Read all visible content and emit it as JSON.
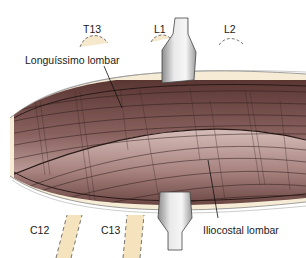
{
  "figure": {
    "labels": {
      "longissimus": "Longuíssimo lombar",
      "iliocostal": "Iliocostal lombar",
      "t13": "T13",
      "l1": "L1",
      "l2": "L2",
      "c12": "C12",
      "c13": "C13"
    },
    "colors": {
      "muscle_dark": "#5e3a38",
      "muscle_light": "#c9aaa6",
      "fascia": "#f6ecd6",
      "bone": "#f5e3bd",
      "spine_gray": "#9a9a9a",
      "line": "#222222"
    }
  }
}
